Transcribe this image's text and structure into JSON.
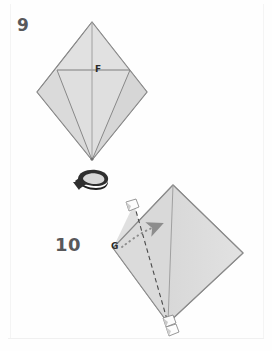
{
  "page": {
    "kind": "origami-instruction-diagram",
    "background_color": "#fefefe"
  },
  "colors": {
    "paper_fill": "#dcdcdc",
    "paper_fill_light": "#e4e4e4",
    "paper_fill_shade": "#d3d3d3",
    "outline": "#8a8a8a",
    "crease_line": "#9a9a9a",
    "fold_dashed": "#555555",
    "motion_arrow": "#8d8d8d",
    "turnover_arrow": "#3a3a3a",
    "label_text": "#2b2b2b",
    "step_number_text": "#58585a",
    "flag_fill": "#fdfdfd"
  },
  "steps": [
    {
      "number": "9",
      "number_position": {
        "x": 17,
        "y": 17
      },
      "shape": "diamond",
      "labels": [
        {
          "text": "F",
          "x": 95,
          "y": 65
        }
      ],
      "creases": [
        "vertical-center-crease",
        "horizontal-crease-at-F",
        "left-diagonal-to-bottom-vertex",
        "right-diagonal-to-bottom-vertex"
      ]
    },
    {
      "number": "10",
      "number_position": {
        "x": 55,
        "y": 236
      },
      "shape": "diamond-rotated",
      "labels": [
        {
          "text": "G",
          "x": 111,
          "y": 242
        }
      ],
      "creases": [
        "vertical-center-crease",
        "dashed-valley-fold-line"
      ],
      "motion": "dotted-arrow-up-right",
      "flags": 3
    }
  ],
  "symbols": {
    "turn_over": {
      "name": "turn-over-arrow",
      "x": 93,
      "y": 180
    }
  },
  "geometry": {
    "step9_diamond": {
      "top": {
        "x": 92,
        "y": 22
      },
      "left": {
        "x": 37,
        "y": 92
      },
      "right": {
        "x": 147,
        "y": 92
      },
      "bottom": {
        "x": 92,
        "y": 160
      },
      "horizontal_crease_y": 70,
      "horizontal_crease_x1": 57,
      "horizontal_crease_x2": 130
    },
    "step10_diamond": {
      "top": {
        "x": 173,
        "y": 185
      },
      "left": {
        "x": 113,
        "y": 248
      },
      "right": {
        "x": 243,
        "y": 253
      },
      "bottom": {
        "x": 168,
        "y": 323
      },
      "dashed_fold_from": {
        "x": 134,
        "y": 204
      },
      "dashed_fold_to": {
        "x": 168,
        "y": 323
      }
    }
  }
}
